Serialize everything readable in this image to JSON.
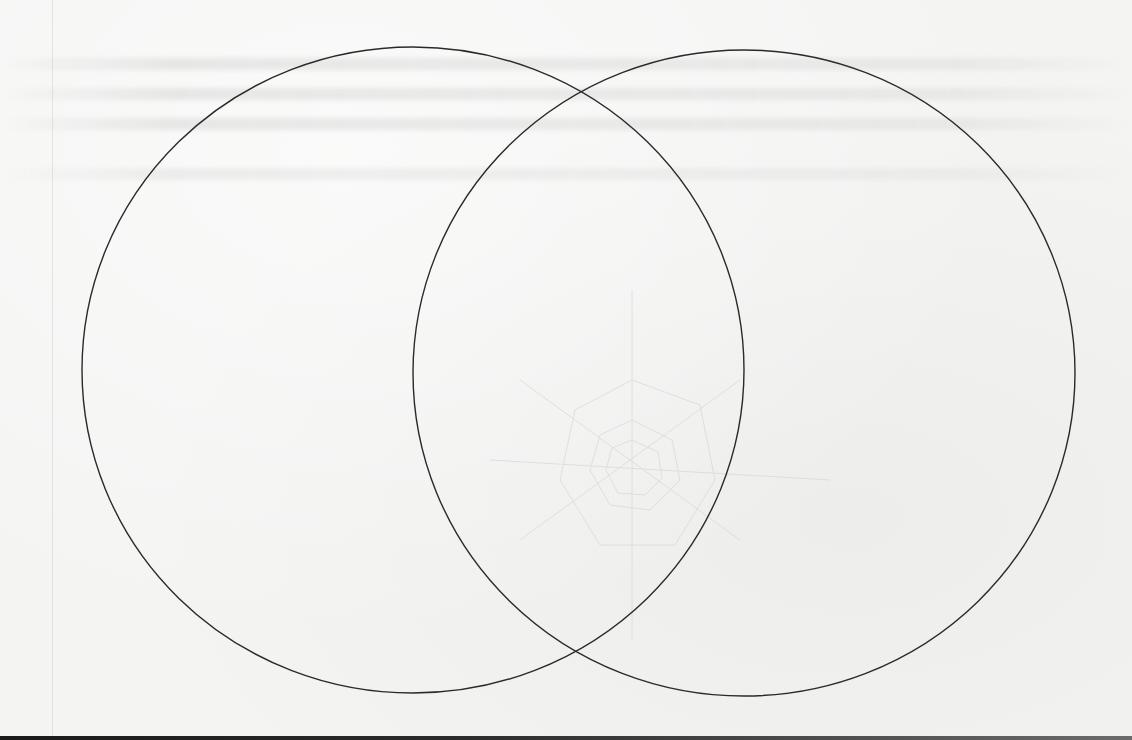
{
  "document": {
    "type": "worksheet",
    "title": "",
    "background_color": "#f4f4f3",
    "line_color": "#2a2a2a"
  },
  "venn_diagram": {
    "set_count": 2,
    "circles": [
      {
        "id": "left",
        "label": "",
        "cx": 413,
        "cy": 370,
        "rx": 331,
        "ry": 323
      },
      {
        "id": "right",
        "label": "",
        "cx": 744,
        "cy": 373,
        "rx": 331,
        "ry": 323
      }
    ],
    "intersection_label": "",
    "region_contents": {
      "left_only": [],
      "overlap": [],
      "right_only": []
    }
  },
  "bleed_through": {
    "visible": true,
    "legible": false,
    "description": "faint mirrored text lines at top and faint sketch in center from reverse side of page"
  }
}
